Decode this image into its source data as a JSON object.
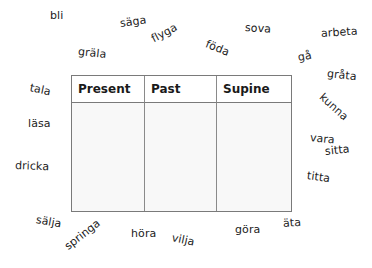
{
  "table": {
    "headers": [
      "Present",
      "Past",
      "Supine"
    ],
    "rows": [
      [
        "",
        "",
        ""
      ]
    ]
  },
  "words": [
    {
      "text": "bli",
      "x": 50,
      "y": 16,
      "rotate": 0
    },
    {
      "text": "säga",
      "x": 120,
      "y": 24,
      "rotate": -8
    },
    {
      "text": "flyga",
      "x": 152,
      "y": 40,
      "rotate": -28
    },
    {
      "text": "gräla",
      "x": 78,
      "y": 52,
      "rotate": 6
    },
    {
      "text": "föda",
      "x": 206,
      "y": 44,
      "rotate": 22
    },
    {
      "text": "sova",
      "x": 245,
      "y": 28,
      "rotate": 4
    },
    {
      "text": "arbeta",
      "x": 321,
      "y": 34,
      "rotate": -4
    },
    {
      "text": "gå",
      "x": 298,
      "y": 58,
      "rotate": -10
    },
    {
      "text": "gråta",
      "x": 327,
      "y": 74,
      "rotate": 6
    },
    {
      "text": "kunna",
      "x": 321,
      "y": 96,
      "rotate": 42
    },
    {
      "text": "vara",
      "x": 310,
      "y": 138,
      "rotate": 6
    },
    {
      "text": "sitta",
      "x": 325,
      "y": 152,
      "rotate": -6
    },
    {
      "text": "titta",
      "x": 307,
      "y": 176,
      "rotate": 8
    },
    {
      "text": "tala",
      "x": 30,
      "y": 88,
      "rotate": 12
    },
    {
      "text": "läsa",
      "x": 28,
      "y": 124,
      "rotate": 0
    },
    {
      "text": "dricka",
      "x": 15,
      "y": 166,
      "rotate": 2
    },
    {
      "text": "sälja",
      "x": 36,
      "y": 220,
      "rotate": 10
    },
    {
      "text": "springa",
      "x": 66,
      "y": 248,
      "rotate": -38
    },
    {
      "text": "höra",
      "x": 131,
      "y": 234,
      "rotate": 0
    },
    {
      "text": "vilja",
      "x": 172,
      "y": 238,
      "rotate": 12
    },
    {
      "text": "göra",
      "x": 235,
      "y": 230,
      "rotate": 0
    },
    {
      "text": "äta",
      "x": 283,
      "y": 224,
      "rotate": -4
    }
  ]
}
